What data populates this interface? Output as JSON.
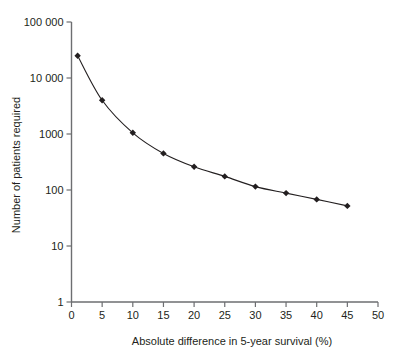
{
  "chart_data": {
    "type": "line",
    "title": "",
    "xlabel": "Absolute difference in 5-year survival (%)",
    "ylabel": "Number of patients required",
    "xlim": [
      0,
      50
    ],
    "ylim": [
      1,
      100000
    ],
    "yscale": "log",
    "grid": false,
    "legend": null,
    "xticks": [
      0,
      5,
      10,
      15,
      20,
      25,
      30,
      35,
      40,
      45,
      50
    ],
    "xticklabels": [
      "0",
      "5",
      "10",
      "15",
      "20",
      "25",
      "30",
      "35",
      "40",
      "45",
      "50"
    ],
    "yticks": [
      1,
      10,
      100,
      1000,
      10000,
      100000
    ],
    "yticklabels": [
      "1",
      "10",
      "100",
      "1000",
      "10 000",
      "100 000"
    ],
    "marker": "diamond",
    "line_color": "#231f20",
    "marker_color": "#231f20",
    "axis_color": "#6d6e71",
    "x": [
      1,
      5,
      10,
      15,
      20,
      25,
      30,
      35,
      40,
      45
    ],
    "values": [
      25000,
      4000,
      1050,
      450,
      260,
      175,
      115,
      88,
      68,
      52
    ],
    "points": [
      {
        "x": 1,
        "y": 25000
      },
      {
        "x": 5,
        "y": 4000
      },
      {
        "x": 10,
        "y": 1050
      },
      {
        "x": 15,
        "y": 450
      },
      {
        "x": 20,
        "y": 260
      },
      {
        "x": 25,
        "y": 175
      },
      {
        "x": 30,
        "y": 115
      },
      {
        "x": 35,
        "y": 88
      },
      {
        "x": 40,
        "y": 68
      },
      {
        "x": 45,
        "y": 52
      }
    ]
  }
}
